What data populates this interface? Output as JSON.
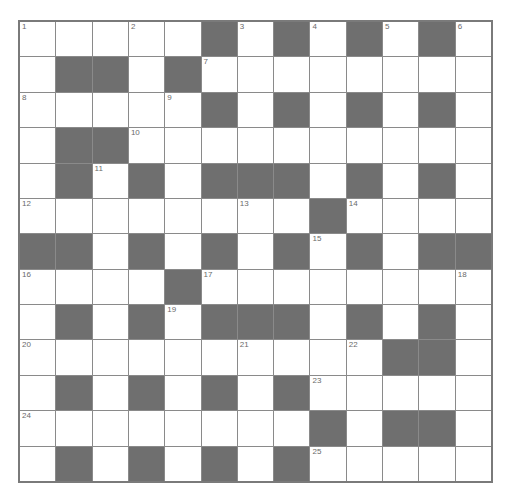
{
  "puzzle": {
    "rows": 13,
    "cols": 13,
    "colors": {
      "block": "#6f6f6f",
      "cell": "#ffffff",
      "line": "#8a8a8a",
      "number": "#6a6a6a"
    },
    "layout": [
      ".....#.#.#.#.",
      ".##.#........",
      ".....#.#.#.#.",
      ".##..........",
      ".#.#.###.#.#.",
      "........#....",
      "##.#.#.#.#.##",
      "....#........",
      ".#.#.###.#.#.",
      "..........##.",
      ".#.#.#.#.....",
      "........#.##.",
      ".#.#.#.#....."
    ],
    "numbers": [
      {
        "r": 0,
        "c": 0,
        "n": "1"
      },
      {
        "r": 0,
        "c": 3,
        "n": "2"
      },
      {
        "r": 0,
        "c": 6,
        "n": "3"
      },
      {
        "r": 0,
        "c": 8,
        "n": "4"
      },
      {
        "r": 0,
        "c": 10,
        "n": "5"
      },
      {
        "r": 0,
        "c": 12,
        "n": "6"
      },
      {
        "r": 1,
        "c": 5,
        "n": "7"
      },
      {
        "r": 2,
        "c": 0,
        "n": "8"
      },
      {
        "r": 2,
        "c": 4,
        "n": "9"
      },
      {
        "r": 3,
        "c": 3,
        "n": "10"
      },
      {
        "r": 4,
        "c": 2,
        "n": "11"
      },
      {
        "r": 5,
        "c": 0,
        "n": "12"
      },
      {
        "r": 5,
        "c": 6,
        "n": "13"
      },
      {
        "r": 5,
        "c": 9,
        "n": "14"
      },
      {
        "r": 6,
        "c": 8,
        "n": "15"
      },
      {
        "r": 7,
        "c": 0,
        "n": "16"
      },
      {
        "r": 7,
        "c": 5,
        "n": "17"
      },
      {
        "r": 7,
        "c": 12,
        "n": "18"
      },
      {
        "r": 8,
        "c": 4,
        "n": "19"
      },
      {
        "r": 9,
        "c": 0,
        "n": "20"
      },
      {
        "r": 9,
        "c": 6,
        "n": "21"
      },
      {
        "r": 9,
        "c": 9,
        "n": "22"
      },
      {
        "r": 10,
        "c": 8,
        "n": "23"
      },
      {
        "r": 11,
        "c": 0,
        "n": "24"
      },
      {
        "r": 12,
        "c": 8,
        "n": "25"
      }
    ]
  }
}
